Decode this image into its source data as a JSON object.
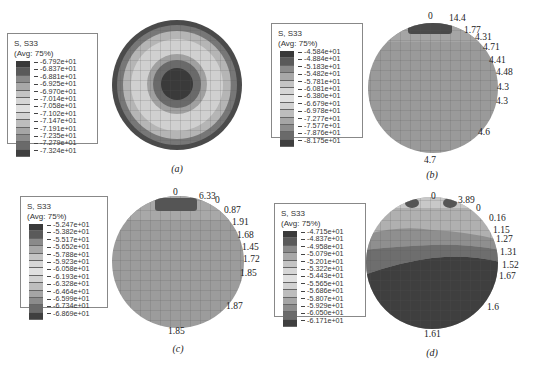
{
  "panels": [
    {
      "id": "a",
      "caption": "(a)",
      "legend": {
        "title": "S, S33",
        "subtitle": "(Avg: 75%)",
        "values": [
          "-6.792e+01",
          "-6.837e+01",
          "-6.881e+01",
          "-6.925e+01",
          "-6.970e+01",
          "-7.014e+01",
          "-7.058e+01",
          "-7.102e+01",
          "-7.147e+01",
          "-7.191e+01",
          "-7.235e+01",
          "-7.279e+01",
          "-7.324e+01"
        ]
      },
      "annotations": []
    },
    {
      "id": "b",
      "caption": "(b)",
      "legend": {
        "title": "S, S33",
        "subtitle": "(Avg: 75%)",
        "values": [
          "-4.584e+01",
          "-4.884e+01",
          "-5.183e+01",
          "-5.482e+01",
          "-5.781e+01",
          "-6.081e+01",
          "-6.380e+01",
          "-6.679e+01",
          "-6.978e+01",
          "-7.277e+01",
          "-7.577e+01",
          "-7.876e+01",
          "-8.175e+01"
        ]
      },
      "annotations": [
        "0",
        "14.4",
        "1.77",
        "4.31",
        "4.71",
        "4.41",
        "4.48",
        "4.3",
        "4.3",
        "4.6",
        "4.7"
      ]
    },
    {
      "id": "c",
      "caption": "(c)",
      "legend": {
        "title": "S, S33",
        "subtitle": "(Avg: 75%)",
        "values": [
          "-5.247e+01",
          "-5.382e+01",
          "-5.517e+01",
          "-5.652e+01",
          "-5.788e+01",
          "-5.923e+01",
          "-6.058e+01",
          "-6.193e+01",
          "-6.328e+01",
          "-6.464e+01",
          "-6.599e+01",
          "-6.734e+01",
          "-6.869e+01"
        ]
      },
      "annotations": [
        "0",
        "6.33",
        "0",
        "0.87",
        "1.91",
        "1.68",
        "1.45",
        "1.72",
        "1.85",
        "1.87",
        "1.85"
      ]
    },
    {
      "id": "d",
      "caption": "(d)",
      "legend": {
        "title": "S, S33",
        "subtitle": "(Avg: 75%)",
        "values": [
          "-4.715e+01",
          "-4.837e+01",
          "-4.958e+01",
          "-5.079e+01",
          "-5.201e+01",
          "-5.322e+01",
          "-5.443e+01",
          "-5.565e+01",
          "-5.686e+01",
          "-5.807e+01",
          "-5.929e+01",
          "-6.050e+01",
          "-6.171e+01"
        ]
      },
      "annotations": [
        "0",
        "3.89",
        "0",
        "0.16",
        "1.15",
        "1.27",
        "1.31",
        "1.52",
        "1.67",
        "1.6",
        "1.61"
      ]
    }
  ],
  "legend_colors": [
    "#3a3a3a",
    "#5a5a5a",
    "#8a8a8a",
    "#a8a8a8",
    "#c4c4c4",
    "#d6d6d6",
    "#e0e0e0",
    "#d2d2d2",
    "#bdbdbd",
    "#a5a5a5",
    "#8c8c8c",
    "#6a6a6a",
    "#3f3f3f"
  ]
}
